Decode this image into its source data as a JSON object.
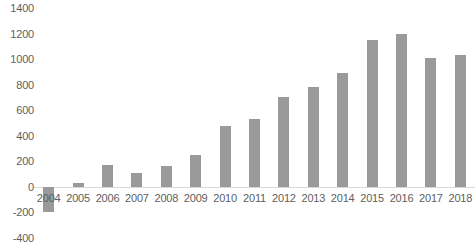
{
  "chart_data": {
    "type": "bar",
    "title": "",
    "subtitle": "",
    "xlabel": "",
    "ylabel": "",
    "categories": [
      "2004",
      "2005",
      "2006",
      "2007",
      "2008",
      "2009",
      "2010",
      "2011",
      "2012",
      "2013",
      "2014",
      "2015",
      "2016",
      "2017",
      "2018"
    ],
    "values": [
      -200,
      30,
      170,
      110,
      160,
      250,
      480,
      530,
      700,
      780,
      890,
      1150,
      1200,
      1010,
      1030
    ],
    "series": [
      {
        "name": "",
        "values": [
          -200,
          30,
          170,
          110,
          160,
          250,
          480,
          530,
          700,
          780,
          890,
          1150,
          1200,
          1010,
          1030
        ]
      }
    ],
    "ylim": [
      -400,
      1400
    ],
    "yticks": [
      1400,
      1200,
      1000,
      800,
      600,
      400,
      200,
      0,
      -200,
      -400
    ],
    "ytick_labels": [
      "1400",
      "1200",
      "1000",
      "800",
      "600",
      "400",
      "200",
      "0",
      "-200",
      "-400"
    ],
    "grid": false,
    "legend": null,
    "bar_color": "#9a9a9a",
    "axis_color": "#d8d8d8",
    "text_color": "#5e5e5e"
  }
}
